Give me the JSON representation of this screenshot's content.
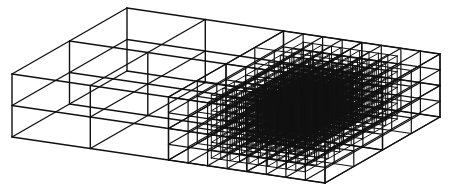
{
  "diagram": {
    "type": "3d-adaptive-mesh-refinement",
    "colors": {
      "background": "#ffffff",
      "line": "#111111"
    },
    "projection": {
      "origin": [
        12,
        137
      ],
      "x_axis": [
        313,
        46
      ],
      "y_axis": [
        115,
        -66
      ],
      "z_axis": [
        0,
        -63
      ]
    },
    "domain_cells": {
      "nx": 8,
      "ny": 4,
      "nz": 4
    },
    "coarse_stroke": 1.3,
    "regions": [
      {
        "name": "coarse-level-0",
        "x": [
          0,
          1
        ],
        "y": [
          0,
          1
        ],
        "z": [
          0,
          1
        ],
        "div": [
          4,
          2,
          2
        ],
        "stroke": 1.4
      },
      {
        "name": "level-1",
        "x": [
          0.5,
          1
        ],
        "y": [
          0,
          1
        ],
        "z": [
          0,
          1
        ],
        "div": [
          8,
          4,
          4
        ],
        "stroke": 1.2
      },
      {
        "name": "level-2",
        "x": [
          0.6,
          0.9
        ],
        "y": [
          0.1,
          0.9
        ],
        "z": [
          0,
          1
        ],
        "div": [
          10,
          8,
          8
        ],
        "stroke": 1.0
      },
      {
        "name": "level-3",
        "x": [
          0.66,
          0.84
        ],
        "y": [
          0.25,
          0.75
        ],
        "z": [
          0.1,
          0.9
        ],
        "div": [
          12,
          10,
          10
        ],
        "stroke": 0.8
      }
    ]
  }
}
